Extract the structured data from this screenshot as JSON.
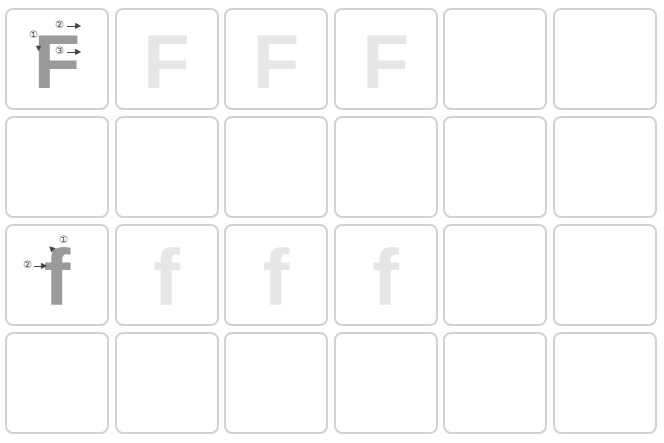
{
  "worksheet": {
    "rows": [
      {
        "type": "uppercase",
        "letter": "F",
        "cells": [
          {
            "kind": "model",
            "letter": "F",
            "strokes": [
              {
                "num": "①",
                "dir": "down"
              },
              {
                "num": "②",
                "dir": "right"
              },
              {
                "num": "③",
                "dir": "right"
              }
            ]
          },
          {
            "kind": "trace",
            "letter": "F"
          },
          {
            "kind": "trace",
            "letter": "F"
          },
          {
            "kind": "trace",
            "letter": "F"
          },
          {
            "kind": "blank",
            "letter": ""
          },
          {
            "kind": "blank",
            "letter": ""
          }
        ]
      },
      {
        "type": "uppercase-practice",
        "cells": [
          {
            "kind": "blank",
            "letter": ""
          },
          {
            "kind": "blank",
            "letter": ""
          },
          {
            "kind": "blank",
            "letter": ""
          },
          {
            "kind": "blank",
            "letter": ""
          },
          {
            "kind": "blank",
            "letter": ""
          },
          {
            "kind": "blank",
            "letter": ""
          }
        ]
      },
      {
        "type": "lowercase",
        "letter": "f",
        "cells": [
          {
            "kind": "model",
            "letter": "f",
            "strokes": [
              {
                "num": "①",
                "dir": "curve-left"
              },
              {
                "num": "②",
                "dir": "right"
              }
            ]
          },
          {
            "kind": "trace",
            "letter": "f"
          },
          {
            "kind": "trace",
            "letter": "f"
          },
          {
            "kind": "trace",
            "letter": "f"
          },
          {
            "kind": "blank",
            "letter": ""
          },
          {
            "kind": "blank",
            "letter": ""
          }
        ]
      },
      {
        "type": "lowercase-practice",
        "cells": [
          {
            "kind": "blank",
            "letter": ""
          },
          {
            "kind": "blank",
            "letter": ""
          },
          {
            "kind": "blank",
            "letter": ""
          },
          {
            "kind": "blank",
            "letter": ""
          },
          {
            "kind": "blank",
            "letter": ""
          },
          {
            "kind": "blank",
            "letter": ""
          }
        ]
      }
    ],
    "stroke_labels": {
      "one": "①",
      "two": "②",
      "three": "③"
    },
    "colors": {
      "border": "#d2d2d2",
      "model": "#9a9a9a",
      "trace": "#e6e6e6",
      "marker": "#444444"
    }
  }
}
